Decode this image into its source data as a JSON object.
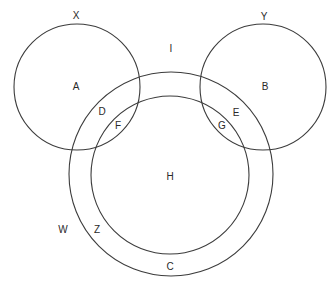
{
  "diagram": {
    "type": "venn",
    "circles": [
      {
        "id": "X",
        "cx": 77,
        "cy": 87,
        "r": 63
      },
      {
        "id": "Y",
        "cx": 263,
        "cy": 87,
        "r": 63
      },
      {
        "id": "W",
        "cx": 171,
        "cy": 174,
        "r": 102
      },
      {
        "id": "Z",
        "cx": 170,
        "cy": 175,
        "r": 79
      }
    ],
    "set_labels": {
      "X": "X",
      "Y": "Y",
      "W": "W",
      "Z": "Z",
      "I": "I"
    },
    "region_labels": {
      "A": "A",
      "B": "B",
      "C": "C",
      "D": "D",
      "E": "E",
      "F": "F",
      "G": "G",
      "H": "H"
    },
    "stroke_color": "#3c3c3c",
    "text_color": "#2a2a2a"
  }
}
